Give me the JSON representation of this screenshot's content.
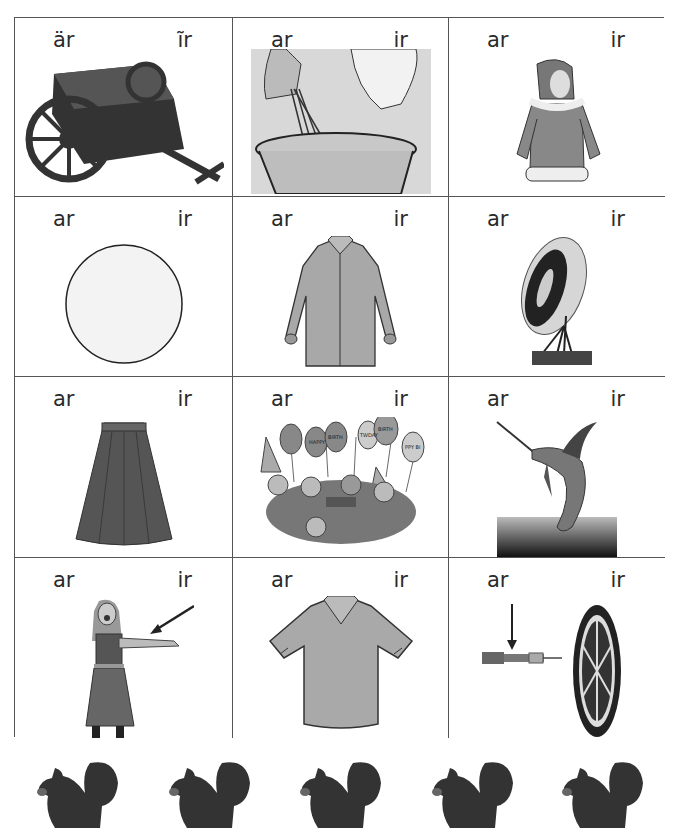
{
  "worksheet": {
    "cells": [
      {
        "left_label": "är",
        "right_label": "ĩr",
        "picture": "cart-icon"
      },
      {
        "left_label": "ar",
        "right_label": "ir",
        "picture": "stir-icon"
      },
      {
        "left_label": "ar",
        "right_label": "ir",
        "picture": "parka-icon"
      },
      {
        "left_label": "ar",
        "right_label": "ir",
        "picture": "circle-icon"
      },
      {
        "left_label": "ar",
        "right_label": "ir",
        "picture": "long-shirt-icon"
      },
      {
        "left_label": "ar",
        "right_label": "ir",
        "picture": "target-icon"
      },
      {
        "left_label": "ar",
        "right_label": "ir",
        "picture": "skirt-icon"
      },
      {
        "left_label": "ar",
        "right_label": "ir",
        "picture": "birthday-party-icon"
      },
      {
        "left_label": "ar",
        "right_label": "ir",
        "picture": "marlin-icon"
      },
      {
        "left_label": "ar",
        "right_label": "ir",
        "picture": "girl-arm-icon"
      },
      {
        "left_label": "ar",
        "right_label": "ir",
        "picture": "shirt-icon"
      },
      {
        "left_label": "ar",
        "right_label": "ir",
        "picture": "dart-icon"
      }
    ],
    "balloon_text": [
      "HAPPY",
      "BIRTH",
      "TWDAY",
      "BIRTH",
      "PPY BI"
    ],
    "footer_icons": [
      "squirrel-icon",
      "squirrel-icon",
      "squirrel-icon",
      "squirrel-icon",
      "squirrel-icon"
    ]
  },
  "colors": {
    "ink": "#2a2a2a",
    "grid_line": "#555555",
    "fill_gray": "#9a9a9a",
    "dark_fill": "#3a3a3a"
  }
}
